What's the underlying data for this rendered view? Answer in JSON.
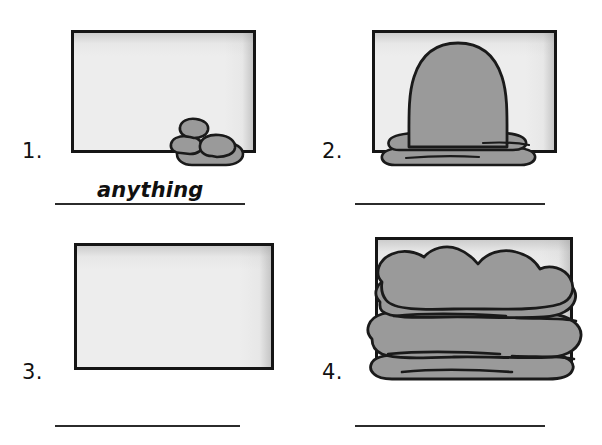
{
  "page": {
    "background_color": "#ffffff",
    "ink_color": "#151515",
    "fill_gray": "#9a9a9a",
    "frame_gray": "#ececec"
  },
  "items": [
    {
      "number": "1.",
      "frame_name": "picture-frame-1",
      "content_description": "small pile of rocks in bottom-right corner of empty frame",
      "fill_amount_percent": 12,
      "answer_value": "anything",
      "answer_placeholder": ""
    },
    {
      "number": "2.",
      "frame_name": "picture-frame-2",
      "content_description": "tall rounded mound with flared base centered in frame",
      "fill_amount_percent": 45,
      "answer_value": "",
      "answer_placeholder": ""
    },
    {
      "number": "3.",
      "frame_name": "picture-frame-3",
      "content_description": "completely empty frame",
      "fill_amount_percent": 0,
      "answer_value": "",
      "answer_placeholder": ""
    },
    {
      "number": "4.",
      "frame_name": "picture-frame-4",
      "content_description": "frame completely filled and overflowing with stacked lumpy rocks",
      "fill_amount_percent": 100,
      "answer_value": "",
      "answer_placeholder": ""
    }
  ]
}
